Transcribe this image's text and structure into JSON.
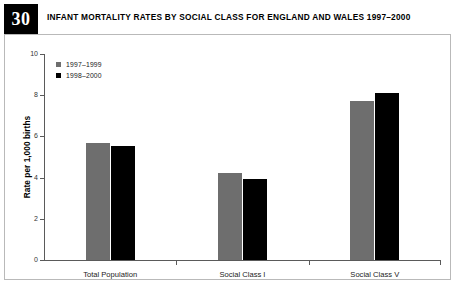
{
  "header": {
    "badge_number": "30",
    "title": "INFANT MORTALITY RATES BY SOCIAL CLASS FOR ENGLAND AND WALES 1997–2000"
  },
  "colors": {
    "series_1997_1999": "#6e6e6e",
    "series_1998_2000": "#000000",
    "axis": "#5a5a5a",
    "frame": "#b9b9b9",
    "badge_background": "#000000",
    "badge_text": "#ffffff"
  },
  "chart_data": {
    "type": "bar",
    "title": "INFANT MORTALITY RATES BY SOCIAL CLASS FOR ENGLAND AND WALES 1997–2000",
    "xlabel": "",
    "ylabel": "Rate per 1,000 births",
    "categories": [
      "Total Population",
      "Social Class I",
      "Social Class V"
    ],
    "series": [
      {
        "name": "1997–1999",
        "values": [
          5.7,
          4.2,
          7.7
        ]
      },
      {
        "name": "1998–2000",
        "values": [
          5.55,
          3.95,
          8.1
        ]
      }
    ],
    "ylim": [
      0,
      10
    ],
    "yticks": [
      0,
      2,
      4,
      6,
      8,
      10
    ],
    "ytick_labels": [
      "0",
      "2",
      "4",
      "6",
      "8",
      "10"
    ],
    "grid": false,
    "legend_position": "top-left"
  }
}
